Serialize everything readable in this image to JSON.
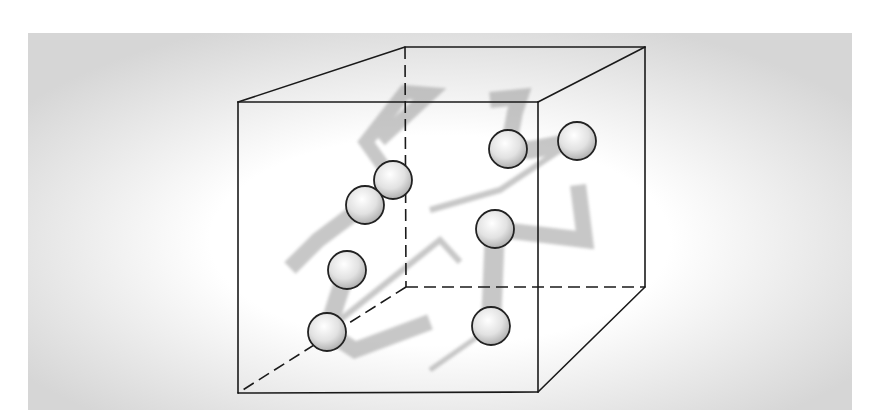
{
  "figure": {
    "kind": "gas-molecules-in-box",
    "canvas": {
      "width": 883,
      "height": 420
    },
    "panel": {
      "x": 28,
      "y": 33,
      "width": 824,
      "height": 377,
      "edge_color": "#d4d4d4",
      "center_color": "#ffffff"
    },
    "colors": {
      "line": "#1a1a1a",
      "trail": "#9a9a9a",
      "sphere_stroke": "#222222",
      "sphere_light": "#ffffff",
      "sphere_mid": "#e2e2e2",
      "sphere_dark": "#a8a8a8"
    },
    "cube": {
      "front": {
        "tl": [
          238,
          102
        ],
        "tr": [
          538,
          102
        ],
        "br": [
          538,
          392
        ],
        "bl": [
          238,
          393
        ]
      },
      "back": {
        "tl": [
          405,
          47
        ],
        "tr": [
          645,
          47
        ],
        "br": [
          645,
          287
        ],
        "bl": [
          406,
          287
        ]
      },
      "solid_edges": [
        [
          "front.tl",
          "front.tr"
        ],
        [
          "front.tr",
          "front.br"
        ],
        [
          "front.br",
          "front.bl"
        ],
        [
          "front.bl",
          "front.tl"
        ],
        [
          "front.tl",
          "back.tl"
        ],
        [
          "back.tl",
          "back.tr"
        ],
        [
          "front.tr",
          "back.tr"
        ],
        [
          "back.tr",
          "back.br"
        ],
        [
          "front.br",
          "back.br"
        ]
      ],
      "hidden_edges": [
        [
          "back.tl",
          "back.bl"
        ],
        [
          "back.bl",
          "back.br"
        ],
        [
          "back.bl",
          "front.bl"
        ]
      ]
    },
    "molecules": [
      {
        "id": "m1",
        "cx": 393,
        "cy": 180,
        "r": 19
      },
      {
        "id": "m2",
        "cx": 365,
        "cy": 205,
        "r": 19
      },
      {
        "id": "m3",
        "cx": 508,
        "cy": 149,
        "r": 19
      },
      {
        "id": "m4",
        "cx": 577,
        "cy": 141,
        "r": 19
      },
      {
        "id": "m5",
        "cx": 495,
        "cy": 229,
        "r": 19
      },
      {
        "id": "m6",
        "cx": 347,
        "cy": 270,
        "r": 19
      },
      {
        "id": "m7",
        "cx": 327,
        "cy": 332,
        "r": 19
      },
      {
        "id": "m8",
        "cx": 491,
        "cy": 326,
        "r": 19
      }
    ],
    "trails": [
      {
        "id": "t1",
        "points": [
          [
            393,
            180
          ],
          [
            366,
            142
          ],
          [
            405,
            92
          ],
          [
            430,
            94
          ],
          [
            380,
            140
          ]
        ],
        "width": 14
      },
      {
        "id": "t2",
        "points": [
          [
            365,
            205
          ],
          [
            318,
            240
          ],
          [
            290,
            268
          ]
        ],
        "width": 16
      },
      {
        "id": "t3",
        "points": [
          [
            508,
            149
          ],
          [
            515,
            112
          ],
          [
            520,
            97
          ],
          [
            490,
            100
          ]
        ],
        "width": 16
      },
      {
        "id": "t4",
        "points": [
          [
            577,
            141
          ],
          [
            530,
            150
          ],
          [
            508,
            149
          ]
        ],
        "width": 18
      },
      {
        "id": "t5",
        "points": [
          [
            495,
            229
          ],
          [
            585,
            240
          ],
          [
            578,
            185
          ]
        ],
        "width": 16
      },
      {
        "id": "t6",
        "points": [
          [
            495,
            229
          ],
          [
            491,
            326
          ]
        ],
        "width": 20
      },
      {
        "id": "t7",
        "points": [
          [
            347,
            270
          ],
          [
            337,
            300
          ],
          [
            327,
            332
          ]
        ],
        "width": 18
      },
      {
        "id": "t8",
        "points": [
          [
            327,
            332
          ],
          [
            355,
            350
          ],
          [
            430,
            322
          ]
        ],
        "width": 16
      },
      {
        "id": "t9",
        "points": [
          [
            430,
            210
          ],
          [
            500,
            190
          ],
          [
            560,
            150
          ]
        ],
        "width": 6
      },
      {
        "id": "t10",
        "points": [
          [
            340,
            320
          ],
          [
            440,
            240
          ],
          [
            460,
            262
          ]
        ],
        "width": 6
      },
      {
        "id": "t11",
        "points": [
          [
            430,
            370
          ],
          [
            480,
            335
          ]
        ],
        "width": 5
      }
    ]
  }
}
